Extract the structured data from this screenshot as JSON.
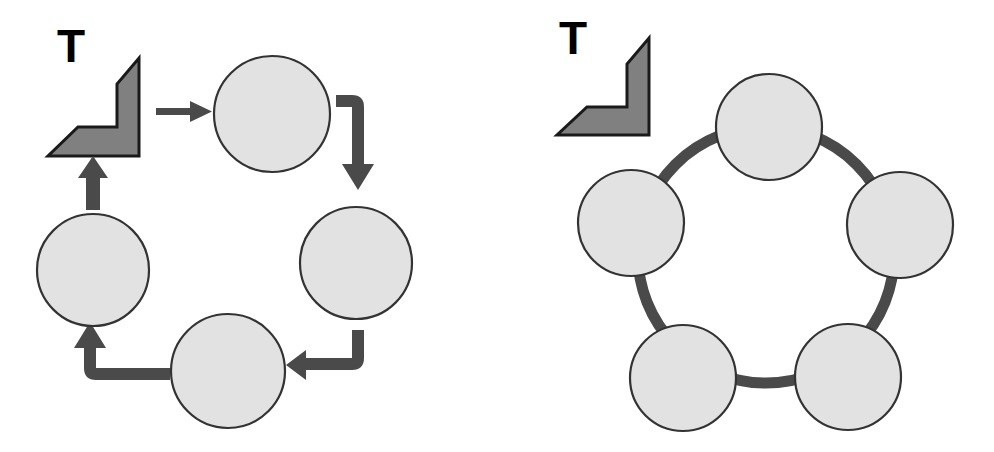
{
  "figure": {
    "title": "",
    "background_color": "#ffffff",
    "width": 994,
    "height": 452,
    "panels": [
      {
        "id": "left-panel",
        "name": "arrow-cycle-diagram",
        "label": "T",
        "label_name": "panel-label-t-left",
        "icon": {
          "name": "corner-arrow-polygon",
          "fill_color": "#808080",
          "stroke_color": "#1a1a1a"
        },
        "node_count": 5,
        "node_fill_color": "#e2e2e2",
        "node_stroke_color": "#333333",
        "connector_type": "arrow",
        "connector_color": "#4a4a4a",
        "connector_count": 5,
        "nodes": [
          {
            "name": "node-top",
            "cx": 272,
            "cy": 114,
            "r": 58,
            "label": ""
          },
          {
            "name": "node-right",
            "cx": 356,
            "cy": 263,
            "r": 56,
            "label": ""
          },
          {
            "name": "node-bottom",
            "cx": 228,
            "cy": 371,
            "r": 57,
            "label": ""
          },
          {
            "name": "node-left",
            "cx": 93,
            "cy": 270,
            "r": 56,
            "label": ""
          },
          {
            "name": "node-origin-shape",
            "cx": 100,
            "cy": 105,
            "r": 0,
            "label": ""
          }
        ],
        "arrows": [
          {
            "name": "arrow-shape-to-top",
            "kind": "straight-right"
          },
          {
            "name": "arrow-top-to-right",
            "kind": "elbow-down"
          },
          {
            "name": "arrow-right-to-bottom",
            "kind": "elbow-left"
          },
          {
            "name": "arrow-bottom-to-left",
            "kind": "elbow-up"
          },
          {
            "name": "arrow-left-to-shape",
            "kind": "straight-up"
          }
        ]
      },
      {
        "id": "right-panel",
        "name": "ring-cycle-diagram",
        "label": "T",
        "label_name": "panel-label-t-right",
        "icon": {
          "name": "corner-arrow-polygon",
          "fill_color": "#808080",
          "stroke_color": "#1a1a1a"
        },
        "node_count": 5,
        "node_fill_color": "#e2e2e2",
        "node_stroke_color": "#333333",
        "connector_type": "ring",
        "connector_color": "#4a4a4a",
        "ring": {
          "cx": 269,
          "cy": 255,
          "r": 128,
          "stroke_width": 11
        },
        "nodes": [
          {
            "name": "node-top",
            "cx": 272,
            "cy": 127,
            "r": 53,
            "label": ""
          },
          {
            "name": "node-right",
            "cx": 403,
            "cy": 225,
            "r": 53,
            "label": ""
          },
          {
            "name": "node-bottom-right",
            "cx": 351,
            "cy": 377,
            "r": 53,
            "label": ""
          },
          {
            "name": "node-bottom-left",
            "cx": 186,
            "cy": 378,
            "r": 53,
            "label": ""
          },
          {
            "name": "node-left",
            "cx": 134,
            "cy": 223,
            "r": 53,
            "label": ""
          }
        ]
      }
    ]
  },
  "colors": {
    "node_fill": "#e2e2e2",
    "node_stroke": "#333333",
    "icon_fill": "#808080",
    "icon_stroke": "#1a1a1a",
    "connector": "#4a4a4a",
    "text": "#000000",
    "background": "#ffffff"
  }
}
